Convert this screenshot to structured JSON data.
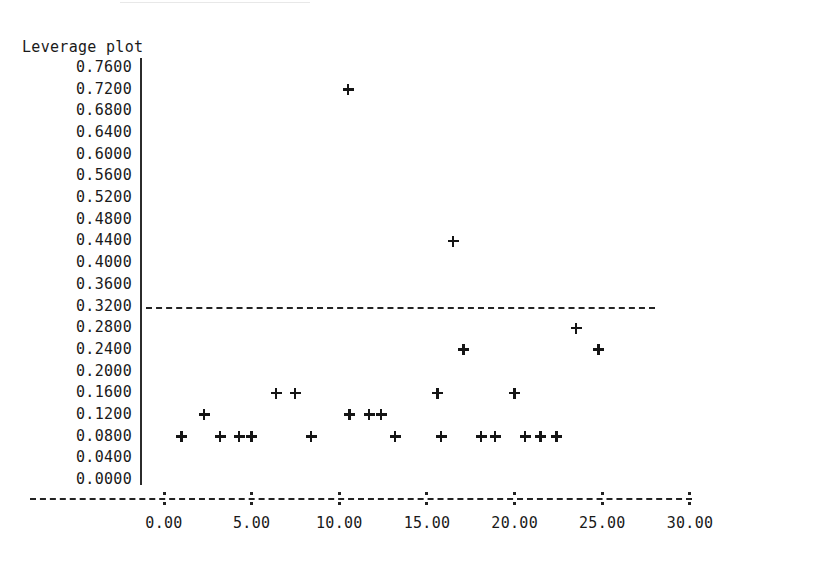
{
  "chart_data": {
    "type": "scatter",
    "title": "Leverage plot",
    "xlabel": "",
    "ylabel": "",
    "xlim": [
      0.0,
      30.0
    ],
    "ylim": [
      0.0,
      0.76
    ],
    "grid": false,
    "legend_position": "none",
    "marker": "plus",
    "x_ticks": [
      "0.00",
      "5.00",
      "10.00",
      "15.00",
      "20.00",
      "25.00",
      "30.00"
    ],
    "x_tick_values": [
      0,
      5,
      10,
      15,
      20,
      25,
      30
    ],
    "y_ticks": [
      "0.7600",
      "0.7200",
      "0.6800",
      "0.6400",
      "0.6000",
      "0.5600",
      "0.5200",
      "0.4800",
      "0.4400",
      "0.4000",
      "0.3600",
      "0.3200",
      "0.2800",
      "0.2400",
      "0.2000",
      "0.1600",
      "0.1200",
      "0.0800",
      "0.0400",
      "0.0000"
    ],
    "y_tick_values": [
      0.76,
      0.72,
      0.68,
      0.64,
      0.6,
      0.56,
      0.52,
      0.48,
      0.44,
      0.4,
      0.36,
      0.32,
      0.28,
      0.24,
      0.2,
      0.16,
      0.12,
      0.08,
      0.04,
      0.0
    ],
    "reference_line": {
      "orientation": "horizontal",
      "y": 0.32,
      "style": "dashed",
      "x_start": 0.0,
      "x_end": 28.0,
      "label": ""
    },
    "points": [
      {
        "x": 1.0,
        "y": 0.08
      },
      {
        "x": 2.3,
        "y": 0.12
      },
      {
        "x": 3.2,
        "y": 0.08
      },
      {
        "x": 4.3,
        "y": 0.08
      },
      {
        "x": 5.0,
        "y": 0.08
      },
      {
        "x": 6.4,
        "y": 0.16
      },
      {
        "x": 7.5,
        "y": 0.16
      },
      {
        "x": 8.4,
        "y": 0.08
      },
      {
        "x": 10.5,
        "y": 0.72
      },
      {
        "x": 10.6,
        "y": 0.12
      },
      {
        "x": 11.7,
        "y": 0.12
      },
      {
        "x": 12.4,
        "y": 0.12
      },
      {
        "x": 13.2,
        "y": 0.08
      },
      {
        "x": 15.6,
        "y": 0.16
      },
      {
        "x": 15.8,
        "y": 0.08
      },
      {
        "x": 16.5,
        "y": 0.44
      },
      {
        "x": 17.1,
        "y": 0.24
      },
      {
        "x": 18.1,
        "y": 0.08
      },
      {
        "x": 18.9,
        "y": 0.08
      },
      {
        "x": 20.0,
        "y": 0.16
      },
      {
        "x": 20.6,
        "y": 0.08
      },
      {
        "x": 21.5,
        "y": 0.08
      },
      {
        "x": 22.4,
        "y": 0.08
      },
      {
        "x": 23.5,
        "y": 0.28
      },
      {
        "x": 24.8,
        "y": 0.24
      }
    ]
  },
  "axes": {
    "x_pixel_origin": 164,
    "x_pixel_per_unit": 17.533,
    "y_pixel_zero": 480,
    "y_pixel_per_unit": 542.1
  }
}
